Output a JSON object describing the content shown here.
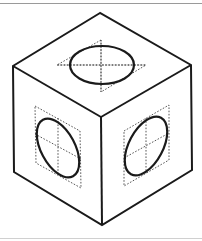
{
  "colors": {
    "background": "#ffffff",
    "edge": "#1a1a1a",
    "guide": "#444444",
    "top_rule": "#9a9a9a",
    "bottom_rule": "#d0d0d0"
  },
  "cube": {
    "outline_points": "100,13 13,66 14,172 102,225 192,170 191,65",
    "inner_edges": {
      "left_to_center": "13,66 101,117",
      "right_to_center": "191,65 101,117",
      "center_to_bottom": "101,117 102,225"
    },
    "faces": {
      "top": {
        "guide_diamond": "101,40 57,65 146,65 101,92",
        "guide_axis_h": "57,65 146,65",
        "guide_axis_v": "101,40 101,92",
        "ellipse": {
          "cx": 102,
          "cy": 65,
          "rx": 32,
          "ry": 19,
          "rotate": 0
        }
      },
      "left": {
        "guide_parallelogram": "35,106 80,131 81,188 36,163",
        "guide_axis_a": "35,134 81,159",
        "guide_axis_b": "58,118 58,175",
        "ellipse": {
          "cx": 58,
          "cy": 148,
          "rx": 17,
          "ry": 32,
          "rotate": -28
        }
      },
      "right": {
        "guide_parallelogram": "124,131 169,105 169,160 124,186",
        "guide_axis_a": "124,158 169,133",
        "guide_axis_b": "146,118 146,173",
        "ellipse": {
          "cx": 146,
          "cy": 146,
          "rx": 17,
          "ry": 32,
          "rotate": 28
        }
      }
    }
  }
}
